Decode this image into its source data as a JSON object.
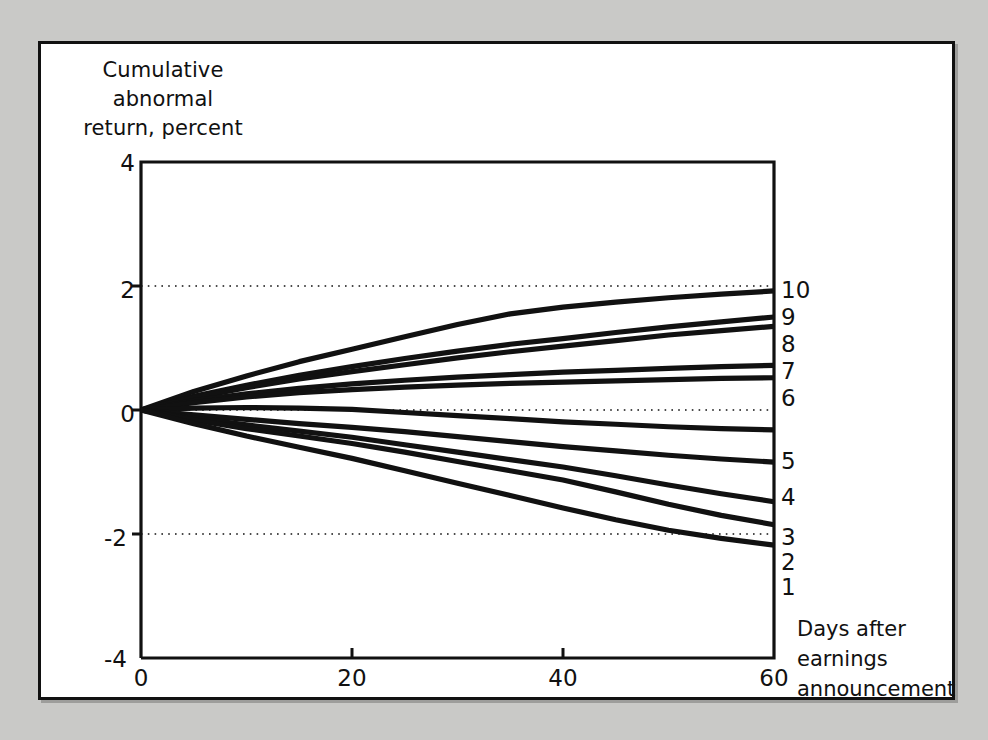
{
  "figure": {
    "background_color": "#c9c9c7",
    "panel_color": "#ffffff",
    "line_color": "#111111"
  },
  "chart_data": {
    "type": "line",
    "title": "",
    "ylabel": "Cumulative abnormal return, percent",
    "ylabel_lines": [
      "Cumulative",
      "abnormal",
      "return, percent"
    ],
    "xlabel": "Days after earnings announcement",
    "xlabel_lines": [
      "Days after",
      "earnings",
      "announcement"
    ],
    "xlim": [
      0,
      60
    ],
    "ylim": [
      -4,
      4
    ],
    "xticks": [
      0,
      20,
      40,
      60
    ],
    "xtick_labels": [
      "0",
      "20",
      "40",
      "60"
    ],
    "yticks": [
      4,
      2,
      0,
      -2,
      -4
    ],
    "ytick_labels": [
      "4",
      "2",
      "0",
      "-2",
      "-4"
    ],
    "gridlines_y": [
      2,
      0,
      -2
    ],
    "grid": "dotted horizontal at 2, 0 and -2",
    "legend_position": "right-end-of-line labels",
    "x": [
      0,
      5,
      10,
      15,
      20,
      25,
      30,
      35,
      40,
      45,
      50,
      55,
      60
    ],
    "series": [
      {
        "name": "10",
        "label": "10",
        "values": [
          0.0,
          0.3,
          0.55,
          0.78,
          0.98,
          1.18,
          1.38,
          1.55,
          1.66,
          1.74,
          1.81,
          1.87,
          1.92
        ]
      },
      {
        "name": "9",
        "label": "9",
        "values": [
          0.0,
          0.22,
          0.4,
          0.56,
          0.7,
          0.83,
          0.95,
          1.06,
          1.15,
          1.25,
          1.34,
          1.42,
          1.5
        ]
      },
      {
        "name": "8",
        "label": "8",
        "values": [
          0.0,
          0.2,
          0.36,
          0.5,
          0.62,
          0.73,
          0.84,
          0.94,
          1.03,
          1.12,
          1.21,
          1.28,
          1.35
        ]
      },
      {
        "name": "7",
        "label": "7",
        "values": [
          0.0,
          0.15,
          0.26,
          0.35,
          0.42,
          0.48,
          0.53,
          0.57,
          0.61,
          0.64,
          0.67,
          0.7,
          0.72
        ]
      },
      {
        "name": "6",
        "label": "6",
        "values": [
          0.0,
          0.12,
          0.21,
          0.28,
          0.33,
          0.37,
          0.4,
          0.43,
          0.45,
          0.47,
          0.49,
          0.51,
          0.52
        ]
      },
      {
        "name": "5",
        "label": "5",
        "values": [
          0.0,
          0.03,
          0.04,
          0.03,
          0.01,
          -0.04,
          -0.09,
          -0.14,
          -0.19,
          -0.23,
          -0.27,
          -0.3,
          -0.32
        ]
      },
      {
        "name": "4",
        "label": "4",
        "values": [
          0.0,
          -0.08,
          -0.15,
          -0.22,
          -0.28,
          -0.35,
          -0.43,
          -0.51,
          -0.59,
          -0.66,
          -0.73,
          -0.79,
          -0.84
        ]
      },
      {
        "name": "3",
        "label": "3",
        "values": [
          0.0,
          -0.13,
          -0.24,
          -0.34,
          -0.44,
          -0.56,
          -0.68,
          -0.8,
          -0.92,
          -1.06,
          -1.21,
          -1.35,
          -1.48
        ]
      },
      {
        "name": "2",
        "label": "2",
        "values": [
          0.0,
          -0.16,
          -0.3,
          -0.42,
          -0.54,
          -0.68,
          -0.83,
          -0.98,
          -1.13,
          -1.32,
          -1.52,
          -1.7,
          -1.85
        ]
      },
      {
        "name": "1",
        "label": "1",
        "values": [
          0.0,
          -0.22,
          -0.42,
          -0.6,
          -0.78,
          -0.98,
          -1.18,
          -1.38,
          -1.58,
          -1.77,
          -1.94,
          -2.07,
          -2.18
        ]
      }
    ]
  }
}
